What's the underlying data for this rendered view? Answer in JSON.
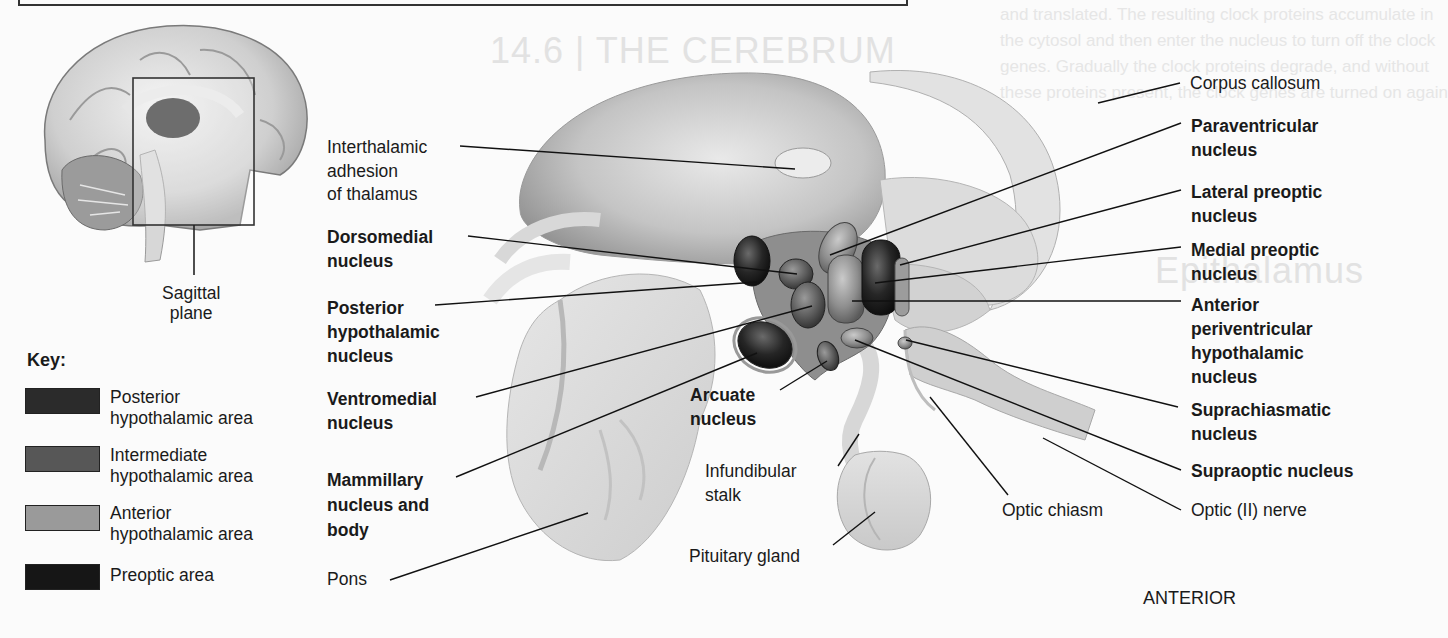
{
  "figure": {
    "orientation_label": "ANTERIOR",
    "inset": {
      "label": "Sagittal\nplane",
      "label_lines": [
        "Sagittal",
        "plane"
      ]
    },
    "key": {
      "title": "Key:",
      "items": [
        {
          "lines": [
            "Posterior",
            "hypothalamic area"
          ],
          "color": "#2b2b2b"
        },
        {
          "lines": [
            "Intermediate",
            "hypothalamic area"
          ],
          "color": "#575757"
        },
        {
          "lines": [
            "Anterior",
            "hypothalamic area"
          ],
          "color": "#9a9a9a"
        },
        {
          "lines": [
            "Preoptic area"
          ],
          "color": "#161616"
        }
      ]
    },
    "left_labels": [
      {
        "lines": [
          "Interthalamic",
          "adhesion",
          "of thalamus"
        ],
        "bold": false
      },
      {
        "lines": [
          "Dorsomedial",
          "nucleus"
        ],
        "bold": true
      },
      {
        "lines": [
          "Posterior",
          "hypothalamic",
          "nucleus"
        ],
        "bold": true
      },
      {
        "lines": [
          "Ventromedial",
          "nucleus"
        ],
        "bold": true
      },
      {
        "lines": [
          "Mammillary",
          "nucleus and",
          "body"
        ],
        "bold": true
      },
      {
        "lines": [
          "Pons"
        ],
        "bold": false
      }
    ],
    "center_labels": [
      {
        "lines": [
          "Arcuate",
          "nucleus"
        ],
        "bold": true
      },
      {
        "lines": [
          "Infundibular",
          "stalk"
        ],
        "bold": false
      },
      {
        "lines": [
          "Pituitary gland"
        ],
        "bold": false
      },
      {
        "lines": [
          "Optic chiasm"
        ],
        "bold": false
      }
    ],
    "right_labels": [
      {
        "lines": [
          "Corpus callosum"
        ],
        "bold": false
      },
      {
        "lines": [
          "Paraventricular",
          "nucleus"
        ],
        "bold": true
      },
      {
        "lines": [
          "Lateral preoptic",
          "nucleus"
        ],
        "bold": true
      },
      {
        "lines": [
          "Medial preoptic",
          "nucleus"
        ],
        "bold": true
      },
      {
        "lines": [
          "Anterior",
          "periventricular",
          "hypothalamic",
          "nucleus"
        ],
        "bold": true
      },
      {
        "lines": [
          "Suprachiasmatic",
          "nucleus"
        ],
        "bold": true
      },
      {
        "lines": [
          "Supraoptic nucleus"
        ],
        "bold": true
      },
      {
        "lines": [
          "Optic (II) nerve"
        ],
        "bold": false
      }
    ]
  },
  "background_bleed": {
    "heading": "14.6 | THE CEREBRUM",
    "subheading": "Epithalamus",
    "lines": [
      "and translated. The resulting clock proteins accumulate in",
      "the cytosol and then enter the nucleus to turn off the clock",
      "genes. Gradually the clock proteins degrade, and without",
      "these proteins present, the clock genes are turned on again"
    ]
  }
}
